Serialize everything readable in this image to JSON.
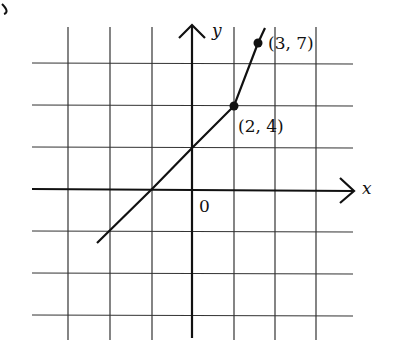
{
  "chart_data": {
    "type": "line",
    "title": "",
    "xlabel": "x",
    "ylabel": "y",
    "origin_label": "0",
    "grid": true,
    "grid_px": {
      "vertical": [
        68,
        110,
        152,
        193,
        234,
        275,
        316
      ],
      "horizontal": [
        63,
        105,
        147,
        189,
        231,
        273,
        315
      ],
      "origin": [
        193,
        189
      ]
    },
    "series": [
      {
        "name": "piecewise",
        "points_px": [
          [
            97,
            243
          ],
          [
            152,
            189
          ],
          [
            193,
            147
          ],
          [
            234,
            106
          ],
          [
            258,
            43
          ],
          [
            265,
            28
          ]
        ],
        "labeled_points": [
          {
            "label": "(2, 4)",
            "x": 2,
            "y": 4,
            "px": [
              234,
              106
            ]
          },
          {
            "label": "(3, 7)",
            "x": 3,
            "y": 7,
            "px": [
              258,
              43
            ]
          }
        ]
      }
    ],
    "annotations": [
      "(2, 4)",
      "(3, 7)",
      "0"
    ],
    "corner_mark": "g"
  },
  "labels": {
    "x_axis": "x",
    "y_axis": "y",
    "origin": "0",
    "point_a": "(2, 4)",
    "point_b": "(3, 7)"
  }
}
